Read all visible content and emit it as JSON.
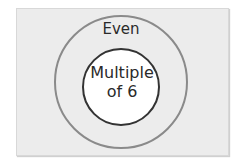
{
  "diagram": {
    "type": "euler",
    "sets": [
      {
        "label": "Even",
        "role": "outer",
        "stroke": "#8a8a8a"
      },
      {
        "label_line1": "Multiple",
        "label_line2": "of 6",
        "role": "inner",
        "stroke": "#333333",
        "fill": "#ffffff"
      }
    ],
    "background": "#ececec"
  }
}
